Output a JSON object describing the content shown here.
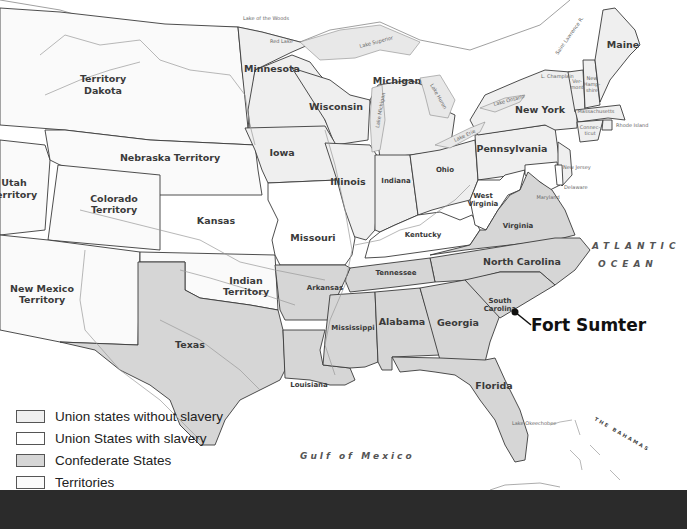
{
  "map": {
    "colors": {
      "union_free": "#efefef",
      "union_slave": "#ffffff",
      "confederate": "#d6d6d6",
      "territory": "#fafafa",
      "border": "#3a3a3a",
      "bottom_bar": "#2b2b2b"
    },
    "regions": {
      "territory_dakota": "Territory\nDakota",
      "territory_dakota_l1": "Territory",
      "territory_dakota_l2": "Dakota",
      "nebraska": "Nebraska Territory",
      "utah_l1": "Utah",
      "utah_l2": "Territory",
      "colorado_l1": "Colorado",
      "colorado_l2": "Territory",
      "kansas": "Kansas",
      "new_mexico_l1": "New Mexico",
      "new_mexico_l2": "Territory",
      "indian_l1": "Indian",
      "indian_l2": "Territory",
      "minnesota": "Minnesota",
      "wisconsin": "Wisconsin",
      "michigan": "Michigan",
      "iowa": "Iowa",
      "illinois": "Illinois",
      "indiana": "Indiana",
      "ohio": "Ohio",
      "missouri": "Missouri",
      "kentucky": "Kentucky",
      "west_virginia_l1": "West",
      "west_virginia_l2": "Virginia",
      "pennsylvania": "Pennsylvania",
      "new_york": "New York",
      "maine": "Maine",
      "vermont_l1": "Ver-",
      "vermont_l2": "mont",
      "new_hampshire_l1": "New",
      "new_hampshire_l2": "Hamp-",
      "new_hampshire_l3": "shire",
      "massachusetts": "Massachusetts",
      "connecticut_l1": "Connec-",
      "connecticut_l2": "ticut",
      "rhode_island": "Rhode Island",
      "new_jersey": "New Jersey",
      "delaware": "Delaware",
      "maryland": "Maryland",
      "virginia": "Virginia",
      "north_carolina": "North Carolina",
      "south_carolina_l1": "South",
      "south_carolina_l2": "Carolina",
      "tennessee": "Tennessee",
      "arkansas": "Arkansas",
      "texas": "Texas",
      "louisiana": "Louisiana",
      "mississippi": "Mississippi",
      "alabama": "Alabama",
      "georgia": "Georgia",
      "florida": "Florida"
    },
    "water": {
      "lake_superior": "Lake Superior",
      "lake_michigan": "Lake Michigan",
      "lake_huron": "Lake Huron",
      "lake_erie": "Lake Erie",
      "lake_ontario": "Lake Ontario",
      "lake_of_the_woods": "Lake of the Woods",
      "red_lake": "Red Lake",
      "lake_champlain": "L. Champlain",
      "st_lawrence": "Saint Lawrence R.",
      "lake_okeechobee": "Lake Okeechobee",
      "atlantic_l1": "ATLANTIC",
      "atlantic_l2": "OCEAN",
      "gulf": "Gulf of Mexico",
      "bahamas": "THE BAHAMAS",
      "cuba": "CUBA"
    },
    "rivers": {
      "missouri": "Missouri",
      "yellowstone": "Yellowstone",
      "arkansas": "Arkansas",
      "red": "Red River",
      "ohio": "Ohio",
      "mississippi": "Mississippi",
      "colorado": "Colorado",
      "rio_grande": "Rio Grande"
    },
    "marker": {
      "label": "Fort Sumter"
    }
  },
  "legend": {
    "items": [
      {
        "label": "Union states without slavery",
        "color": "#efefef"
      },
      {
        "label": "Union States with slavery",
        "color": "#ffffff"
      },
      {
        "label": "Confederate States",
        "color": "#d6d6d6"
      },
      {
        "label": "Territories",
        "color": "#fafafa"
      }
    ]
  }
}
